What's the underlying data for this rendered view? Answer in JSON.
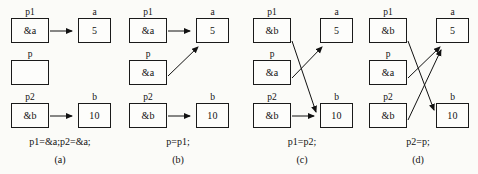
{
  "figure": {
    "stroke_color": "#111111",
    "background_color": "#fbfbf8"
  },
  "panels": [
    {
      "id": "a",
      "caption_statement": "p1=&a;p2=&a;",
      "caption_id": "(a)",
      "nodes": {
        "p1": {
          "label": "p1",
          "value": "&a"
        },
        "p": {
          "label": "p",
          "value": ""
        },
        "p2": {
          "label": "p2",
          "value": "&b"
        },
        "a": {
          "label": "a",
          "value": "5"
        },
        "b": {
          "label": "b",
          "value": "10"
        }
      },
      "edges": [
        {
          "from": "p1",
          "to": "a",
          "kind": "horizontal"
        },
        {
          "from": "p2",
          "to": "b",
          "kind": "horizontal"
        }
      ]
    },
    {
      "id": "b",
      "caption_statement": "p=p1;",
      "caption_id": "(b)",
      "nodes": {
        "p1": {
          "label": "p1",
          "value": "&a"
        },
        "p": {
          "label": "p",
          "value": "&a"
        },
        "p2": {
          "label": "p2",
          "value": "&b"
        },
        "a": {
          "label": "a",
          "value": "5"
        },
        "b": {
          "label": "b",
          "value": "10"
        }
      },
      "edges": [
        {
          "from": "p1",
          "to": "a",
          "kind": "horizontal"
        },
        {
          "from": "p",
          "to": "a",
          "kind": "diagonal-up"
        },
        {
          "from": "p2",
          "to": "b",
          "kind": "horizontal"
        }
      ]
    },
    {
      "id": "c",
      "caption_statement": "p1=p2;",
      "caption_id": "(c)",
      "nodes": {
        "p1": {
          "label": "p1",
          "value": "&b"
        },
        "p": {
          "label": "p",
          "value": "&a"
        },
        "p2": {
          "label": "p2",
          "value": "&b"
        },
        "a": {
          "label": "a",
          "value": "5"
        },
        "b": {
          "label": "b",
          "value": "10"
        }
      },
      "edges": [
        {
          "from": "p1",
          "to": "b",
          "kind": "diagonal-down"
        },
        {
          "from": "p",
          "to": "a",
          "kind": "diagonal-up"
        },
        {
          "from": "p2",
          "to": "b",
          "kind": "horizontal"
        }
      ]
    },
    {
      "id": "d",
      "caption_statement": "p2=p;",
      "caption_id": "(d)",
      "nodes": {
        "p1": {
          "label": "p1",
          "value": "&b"
        },
        "p": {
          "label": "p",
          "value": "&a"
        },
        "p2": {
          "label": "p2",
          "value": "&b"
        },
        "a": {
          "label": "a",
          "value": "5"
        },
        "b": {
          "label": "b",
          "value": "10"
        }
      },
      "edges": [
        {
          "from": "p1",
          "to": "b",
          "kind": "diagonal-down"
        },
        {
          "from": "p",
          "to": "a",
          "kind": "diagonal-up"
        },
        {
          "from": "p2",
          "to": "a",
          "kind": "diagonal-up-long"
        }
      ]
    }
  ]
}
